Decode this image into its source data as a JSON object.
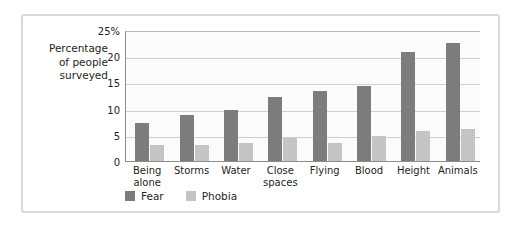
{
  "chart_data": {
    "type": "bar",
    "title": "",
    "subtitle": "",
    "xlabel": "",
    "ylabel": "Percentage of people surveyed",
    "ylabel_lines": [
      "Percentage",
      "of people",
      "surveyed"
    ],
    "categories": [
      "Being alone",
      "Storms",
      "Water",
      "Close spaces",
      "Flying",
      "Blood",
      "Height",
      "Animals"
    ],
    "category_lines": [
      [
        "Being",
        "alone"
      ],
      [
        "Storms"
      ],
      [
        "Water"
      ],
      [
        "Close",
        "spaces"
      ],
      [
        "Flying"
      ],
      [
        "Blood"
      ],
      [
        "Height"
      ],
      [
        "Animals"
      ]
    ],
    "series": [
      {
        "name": "Fear",
        "color": "#7c7c7c",
        "values": [
          7.3,
          8.8,
          9.7,
          12.2,
          13.4,
          14.3,
          20.8,
          22.6
        ]
      },
      {
        "name": "Phobia",
        "color": "#c4c4c4",
        "values": [
          3.1,
          3.0,
          3.5,
          4.3,
          3.4,
          4.7,
          5.7,
          6.2
        ]
      }
    ],
    "ylim": [
      0,
      25
    ],
    "yticks": [
      0,
      5,
      10,
      15,
      20,
      25
    ],
    "ytick_labels": [
      "0",
      "5",
      "10",
      "15",
      "20",
      "25%"
    ],
    "grid": true,
    "grid_axis": "y",
    "legend_position": "bottom-left",
    "legend": [
      "Fear",
      "Phobia"
    ],
    "plot_background": "#fbfbfb",
    "frame_color": "#d8d8d8"
  }
}
